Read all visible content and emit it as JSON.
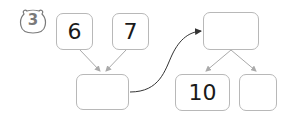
{
  "problem": {
    "number": "3",
    "badge_icon": "bear-head-icon"
  },
  "boxes": {
    "top_left": "6",
    "top_right": "7",
    "sum": "",
    "target": "",
    "split_left": "10",
    "split_right": ""
  },
  "colors": {
    "border": "#b8b8b8",
    "arrow_light": "#aaaaaa",
    "arrow_dark": "#333333"
  }
}
